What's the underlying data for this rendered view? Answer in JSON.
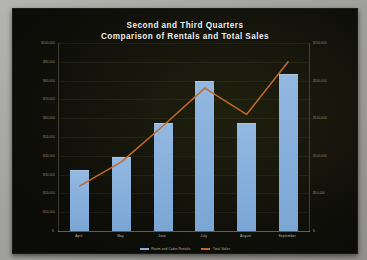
{
  "slide": {
    "title_line1": "Second and Third Quarters",
    "title_line2": "Comparison of Rentals and Total Sales",
    "background_color": "#0d0d0b"
  },
  "legend": {
    "position": "bottom-center",
    "items": [
      {
        "label": "Room and Cabin Rentals",
        "color": "#85aedb",
        "type": "bar"
      },
      {
        "label": "Total Sales",
        "color": "#c1692a",
        "type": "line"
      }
    ]
  },
  "axes": {
    "left_ticks": [
      "$100,000",
      "$90,000",
      "$80,000",
      "$70,000",
      "$60,000",
      "$50,000",
      "$40,000",
      "$30,000",
      "$20,000",
      "$10,000",
      "$-"
    ],
    "right_ticks": [
      "$250,000",
      "$200,000",
      "$150,000",
      "$100,000",
      "$50,000",
      "$-"
    ]
  },
  "chart_data": {
    "type": "bar",
    "title": "Second and Third Quarters Comparison of Rentals and Total Sales",
    "xlabel": "",
    "ylabel": "",
    "categories": [
      "April",
      "May",
      "June",
      "July",
      "August",
      "September"
    ],
    "series": [
      {
        "name": "Room and Cabin Rentals",
        "type": "bar",
        "axis": "left",
        "color": "#85aedb",
        "values": [
          32000,
          39000,
          57000,
          79000,
          57000,
          83000
        ]
      },
      {
        "name": "Total Sales",
        "type": "line",
        "axis": "right",
        "color": "#c1692a",
        "values": [
          60000,
          92000,
          140000,
          190000,
          155000,
          225000
        ]
      }
    ],
    "ylim": [
      0,
      100000
    ],
    "y2lim": [
      0,
      250000
    ],
    "grid": true,
    "legend_position": "bottom"
  }
}
